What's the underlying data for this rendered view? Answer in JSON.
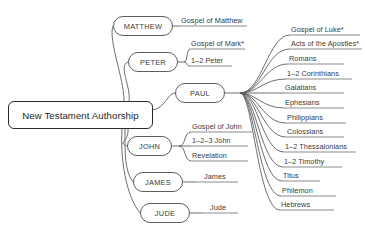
{
  "diagram": {
    "type": "mind-map",
    "title": "New Testament Authorship",
    "root": {
      "label": "New Testament Authorship"
    },
    "colors": {
      "root_border": "#2b2b2b",
      "node_border": "#5d5d5d",
      "line": "#5d5d5d",
      "text": "#3a3a3a",
      "background": "#ffffff"
    },
    "branches": [
      {
        "id": "matthew",
        "label": "MATTHEW",
        "works": [
          {
            "label": "Gospel of Matthew"
          }
        ]
      },
      {
        "id": "peter",
        "label": "PETER",
        "works": [
          {
            "label": "Gospel of Mark*"
          },
          {
            "label": "1–2 Peter"
          }
        ]
      },
      {
        "id": "paul",
        "label": "PAUL",
        "works": [
          {
            "label": "Gospel of Luke*"
          },
          {
            "label": "Acts of the Apostles*"
          },
          {
            "label": "Romans"
          },
          {
            "label": "1–2 Corinthians"
          },
          {
            "label": "Galatians"
          },
          {
            "label": "Ephesians"
          },
          {
            "label": "Philippians"
          },
          {
            "label": "Colossians"
          },
          {
            "label": "1–2 Thessalonians"
          },
          {
            "label": "1–2 Timothy"
          },
          {
            "label": "Titus"
          },
          {
            "label": "Philemon"
          },
          {
            "label": "Hebrews"
          }
        ]
      },
      {
        "id": "john",
        "label": "JOHN",
        "works": [
          {
            "label": "Gospel of John"
          },
          {
            "label": "1–2–3 John"
          },
          {
            "label": "Revelation"
          }
        ]
      },
      {
        "id": "james",
        "label": "JAMES",
        "works": [
          {
            "label": "James"
          }
        ]
      },
      {
        "id": "jude",
        "label": "JUDE",
        "works": [
          {
            "label": "Jude"
          }
        ]
      }
    ]
  }
}
